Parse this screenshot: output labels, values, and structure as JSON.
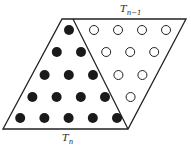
{
  "diagram": {
    "labels": {
      "top": {
        "base": "T",
        "sub": "n−1"
      },
      "bottom": {
        "base": "T",
        "sub": "n"
      }
    },
    "filled_triangle": {
      "name": "T_n",
      "rows": [
        1,
        2,
        3,
        4,
        5
      ],
      "color": "#1a1a1a"
    },
    "open_triangle": {
      "name": "T_n-1",
      "rows": [
        4,
        3,
        2,
        1
      ],
      "color": "#ffffff"
    },
    "line_color": "#222222"
  }
}
